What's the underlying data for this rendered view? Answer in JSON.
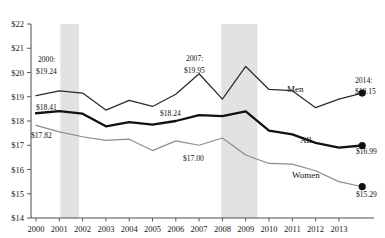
{
  "chart_data": {
    "type": "line",
    "title": "",
    "xlabel": "",
    "ylabel": "",
    "ylim": [
      14,
      22
    ],
    "ytick_labels": [
      "$22",
      "$21",
      "$20",
      "$19",
      "$18",
      "$17",
      "$16",
      "$15",
      "$14"
    ],
    "ytick_values": [
      22,
      21,
      20,
      19,
      18,
      17,
      16,
      15,
      14
    ],
    "grid": false,
    "legend_position": "inline-right",
    "x": [
      2000,
      2001,
      2002,
      2003,
      2004,
      2005,
      2006,
      2007,
      2008,
      2009,
      2010,
      2011,
      2012,
      2013,
      2014
    ],
    "xtick_labels": [
      "2000",
      "2001",
      "2002",
      "2003",
      "2004",
      "2005",
      "2006",
      "2007",
      "2008",
      "2009",
      "2010",
      "2011",
      "2012",
      "2013"
    ],
    "series": [
      {
        "name": "Men",
        "color": "#2b2b2b",
        "values": [
          19.05,
          19.24,
          19.15,
          18.45,
          18.85,
          18.6,
          19.1,
          19.95,
          18.9,
          20.25,
          19.3,
          19.25,
          18.55,
          18.9,
          19.15
        ]
      },
      {
        "name": "All",
        "color": "#111111",
        "values": [
          18.32,
          18.41,
          18.3,
          17.78,
          17.95,
          17.85,
          18.0,
          18.24,
          18.2,
          18.4,
          17.6,
          17.45,
          17.1,
          16.9,
          16.99
        ]
      },
      {
        "name": "Women",
        "color": "#8c8c8c",
        "values": [
          17.82,
          17.55,
          17.35,
          17.2,
          17.25,
          16.78,
          17.18,
          17.0,
          17.3,
          16.6,
          16.25,
          16.22,
          15.95,
          15.5,
          15.29
        ]
      }
    ],
    "annotations": [
      {
        "id": "ann-2000-men",
        "text_line1": "2000:",
        "text_line2": "$19.24"
      },
      {
        "id": "ann-2000-all",
        "text_line1": "",
        "text_line2": "$18.41"
      },
      {
        "id": "ann-2000-women",
        "text_line1": "",
        "text_line2": "$17.82"
      },
      {
        "id": "ann-2007-men",
        "text_line1": "2007:",
        "text_line2": "$19.95"
      },
      {
        "id": "ann-2007-all",
        "text_line1": "",
        "text_line2": "$18.24"
      },
      {
        "id": "ann-2007-women",
        "text_line1": "",
        "text_line2": "$17.00"
      },
      {
        "id": "ann-2014-men",
        "text_line1": "2014:",
        "text_line2": "$19.15"
      },
      {
        "id": "ann-2014-all",
        "text_line1": "",
        "text_line2": "$16.99"
      },
      {
        "id": "ann-2014-women",
        "text_line1": "",
        "text_line2": "$15.29"
      }
    ],
    "shaded_regions": [
      {
        "name": "recession-2001",
        "start": 2001.05,
        "end": 2001.85,
        "color": "#e0e0e0"
      },
      {
        "name": "recession-2008",
        "start": 2007.95,
        "end": 2009.5,
        "color": "#e0e0e0"
      }
    ],
    "series_labels": {
      "men": "Men",
      "all": "All",
      "women": "Women"
    },
    "endpoint_labels": {
      "men_year": "2014:",
      "men_value": "$19.15",
      "all_value": "$16.99",
      "women_value": "$15.29"
    },
    "left_labels": {
      "men_year": "2000:",
      "men_value": "$19.24",
      "all_value": "$18.41",
      "women_value": "$17.82"
    },
    "mid_labels": {
      "men_year": "2007:",
      "men_value": "$19.95",
      "all_value": "$18.24",
      "women_value": "$17.00"
    }
  }
}
